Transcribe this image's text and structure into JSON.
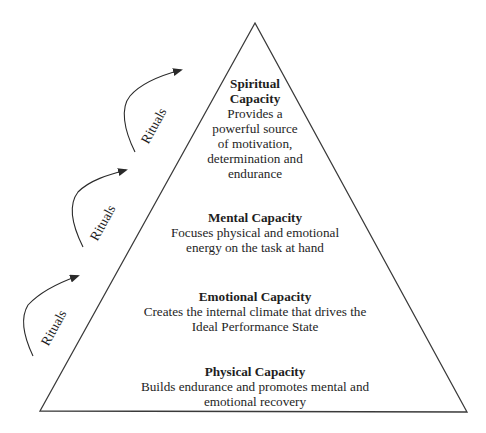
{
  "diagram": {
    "type": "pyramid",
    "levels": [
      {
        "id": "spiritual",
        "title_line1": "Spiritual",
        "title_line2": "Capacity",
        "desc_lines": [
          "Provides a",
          "powerful source",
          "of motivation,",
          "determination and",
          "endurance"
        ]
      },
      {
        "id": "mental",
        "title": "Mental Capacity",
        "desc_lines": [
          "Focuses physical and emotional",
          "energy on the task at hand"
        ]
      },
      {
        "id": "emotional",
        "title": "Emotional Capacity",
        "desc_lines": [
          "Creates the internal climate that drives the",
          "Ideal Performance State"
        ]
      },
      {
        "id": "physical",
        "title": "Physical Capacity",
        "desc_lines": [
          "Builds endurance and promotes mental and",
          "emotional recovery"
        ]
      }
    ],
    "rituals": [
      {
        "label": "Rituals"
      },
      {
        "label": "Rituals"
      },
      {
        "label": "Rituals"
      }
    ],
    "colors": {
      "line": "#3a3a3a",
      "text": "#1e1e1e",
      "background": "#ffffff"
    }
  }
}
